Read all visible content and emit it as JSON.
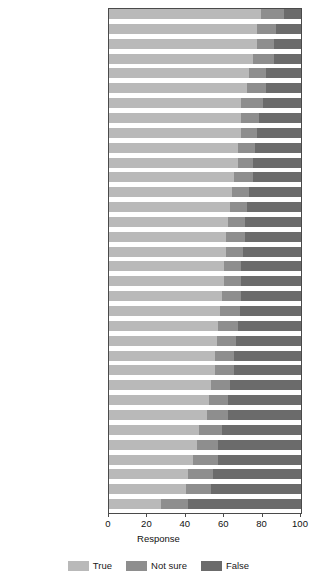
{
  "chart_data": {
    "type": "bar",
    "orientation": "horizontal",
    "stacked": true,
    "percent": true,
    "title": "",
    "xlabel": "Response",
    "ylabel": "",
    "xlim": [
      0,
      100
    ],
    "xticks": [
      0,
      20,
      40,
      60,
      80,
      100
    ],
    "grid": false,
    "legend_position": "bottom",
    "legend_title": "Response",
    "series": [
      {
        "name": "True",
        "color": "#b9b9b9"
      },
      {
        "name": "Not sure",
        "color": "#8e8e8e"
      },
      {
        "name": "False",
        "color": "#6b6b6b"
      }
    ],
    "categories": [
      "Iceland (n = 500)",
      "Denmark (1013)",
      "Sweden (1023)",
      "France (1021)",
      "Japan (2146)",
      "United Kingdom (1308)",
      "Norway (976)",
      "Belgium (1024)",
      "Spain (1035)",
      "Germany (1507)",
      "Italy (1006)",
      "Netherlands (1005)",
      "Hungary (1000)",
      "Luxembourg (518)",
      "Ireland (1008)",
      "Slovenia (1061)",
      "Finland (1006)",
      "Czech Republic (1037)",
      "Estonia (1000)",
      "Portugal (1009)",
      "Malta (500)",
      "Switzerland (999)",
      "Slovak Republic (1241)",
      "Poland (999)",
      "Austria (1034)",
      "Croatia (1000)",
      "Romania (1005)",
      "Greece (1000)",
      "Bulgaria (1008)",
      "Lithuania (1003)",
      "Latvia (1034)",
      "Cyprus (505)",
      "United States (1484)",
      "Turkey (1005)"
    ],
    "values": {
      "True": [
        79,
        77,
        77,
        75,
        73,
        72,
        69,
        69,
        69,
        67,
        67,
        65,
        64,
        63,
        62,
        61,
        61,
        60,
        60,
        59,
        58,
        57,
        56,
        55,
        55,
        53,
        52,
        51,
        47,
        46,
        44,
        41,
        40,
        27
      ],
      "Not sure": [
        12,
        10,
        9,
        11,
        9,
        10,
        11,
        9,
        8,
        9,
        8,
        10,
        9,
        9,
        9,
        10,
        9,
        9,
        9,
        10,
        10,
        10,
        10,
        10,
        10,
        10,
        10,
        11,
        12,
        11,
        13,
        13,
        13,
        14
      ],
      "False": [
        9,
        13,
        14,
        14,
        18,
        18,
        20,
        22,
        23,
        24,
        25,
        25,
        27,
        28,
        29,
        29,
        30,
        31,
        31,
        31,
        32,
        33,
        34,
        35,
        35,
        37,
        38,
        38,
        41,
        43,
        43,
        46,
        47,
        59
      ]
    }
  },
  "axis": {
    "xtick_labels": [
      "0",
      "20",
      "40",
      "60",
      "80",
      "100"
    ],
    "xtitle": "Response"
  },
  "legend": {
    "items": [
      {
        "label": "True",
        "swatch": "true-swatch"
      },
      {
        "label": "Not sure",
        "swatch": "not-sure-swatch"
      },
      {
        "label": "False",
        "swatch": "false-swatch"
      }
    ]
  }
}
